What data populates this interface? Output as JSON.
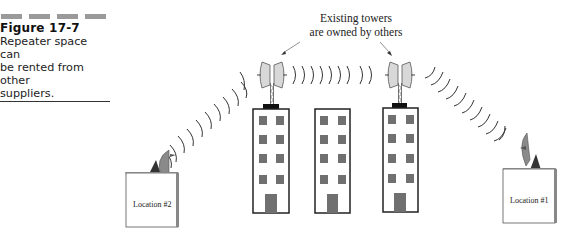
{
  "caption": {
    "figure_label": "Figure 17-7",
    "text_lines": [
      "Repeater space can",
      "be rented from other",
      "suppliers."
    ]
  },
  "annotation": {
    "lines": [
      "Existing towers",
      "are owned by others"
    ]
  },
  "locations": [
    {
      "label": "Location #2"
    },
    {
      "label": "Location #1"
    }
  ],
  "buildings": [
    {
      "name": "tower-building-left",
      "has_antenna": true
    },
    {
      "name": "middle-building",
      "has_antenna": false
    },
    {
      "name": "tower-building-right",
      "has_antenna": true
    }
  ],
  "colors": {
    "window": "#707070",
    "dish": "#8a8a8a",
    "antenna_panel": "#d8d8d8",
    "line": "#222222"
  }
}
